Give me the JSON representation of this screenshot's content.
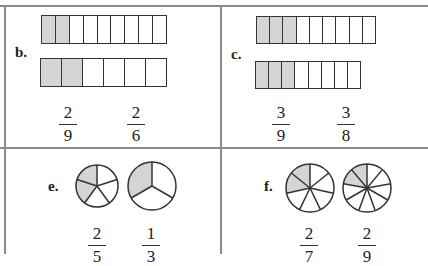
{
  "panels": {
    "b": {
      "label": "b.",
      "bar1": {
        "total": 9,
        "shaded": 2
      },
      "bar2": {
        "total": 6,
        "shaded": 2
      },
      "fractions": [
        {
          "num": "2",
          "den": "9"
        },
        {
          "num": "2",
          "den": "6"
        }
      ]
    },
    "c": {
      "label": "c.",
      "bar1": {
        "total": 9,
        "shaded": 3
      },
      "bar2": {
        "total": 8,
        "shaded": 3
      },
      "fractions": [
        {
          "num": "3",
          "den": "9"
        },
        {
          "num": "3",
          "den": "8"
        }
      ]
    },
    "e": {
      "label": "e.",
      "pie1": {
        "total": 5,
        "shaded": 2
      },
      "pie2": {
        "total": 3,
        "shaded": 1
      },
      "fractions": [
        {
          "num": "2",
          "den": "5"
        },
        {
          "num": "1",
          "den": "3"
        }
      ]
    },
    "f": {
      "label": "f.",
      "pie1": {
        "total": 7,
        "shaded": 2
      },
      "pie2": {
        "total": 9,
        "shaded": 2
      },
      "fractions": [
        {
          "num": "2",
          "den": "7"
        },
        {
          "num": "2",
          "den": "9"
        }
      ]
    }
  },
  "colors": {
    "shade": "#d4d4d4",
    "stroke": "#333333",
    "rule": "#8a8a8a"
  }
}
